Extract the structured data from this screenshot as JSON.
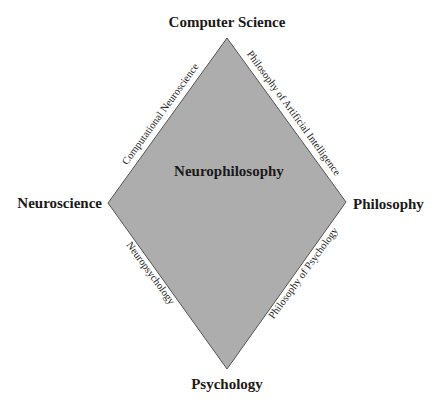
{
  "diagram": {
    "type": "diamond",
    "fill_color": "#adadad",
    "stroke_color": "#555555",
    "center_label": "Neurophilosophy",
    "vertices": {
      "top": "Computer Science",
      "left": "Neuroscience",
      "right": "Philosophy",
      "bottom": "Psychology"
    },
    "edges": {
      "top_left": "Computational Neuroscience",
      "top_right": "Philosophy of Artificial Intelligence",
      "bottom_left": "Neuropsychology",
      "bottom_right": "Philosophy of Psychology"
    }
  }
}
